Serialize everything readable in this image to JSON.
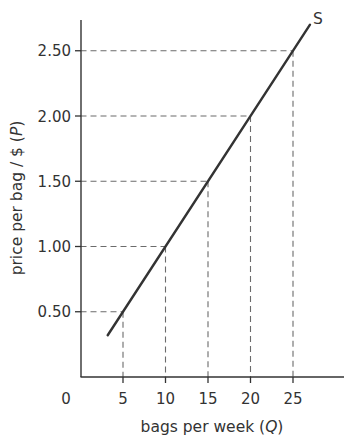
{
  "chart_data": {
    "type": "line",
    "title": "",
    "xlabel": "bags per week (Q)",
    "xlabel_parts": {
      "text": "bags per week (",
      "var": "Q",
      "close": ")"
    },
    "ylabel": "price per bag / $ (P)",
    "ylabel_parts": {
      "text": "price per bag / $ (",
      "var": "P",
      "close": ")"
    },
    "origin_label": "0",
    "x_ticks": [
      5,
      10,
      15,
      20,
      25
    ],
    "x_tick_labels": [
      "5",
      "10",
      "15",
      "20",
      "25"
    ],
    "y_ticks": [
      0.5,
      1.0,
      1.5,
      2.0,
      2.5
    ],
    "y_tick_labels": [
      "0.50",
      "1.00",
      "1.50",
      "2.00",
      "2.50"
    ],
    "xlim": [
      0,
      30
    ],
    "ylim": [
      0,
      2.75
    ],
    "grid": false,
    "legend": "none",
    "series": [
      {
        "name": "S",
        "label": "S",
        "x": [
          3.2,
          27
        ],
        "y": [
          0.32,
          2.7
        ],
        "points": [
          {
            "Q": 5,
            "P": 0.5
          },
          {
            "Q": 10,
            "P": 1.0
          },
          {
            "Q": 15,
            "P": 1.5
          },
          {
            "Q": 20,
            "P": 2.0
          },
          {
            "Q": 25,
            "P": 2.5
          }
        ]
      }
    ],
    "annotations": [
      "dashed reference lines from each (Q, P) point to both axes"
    ],
    "colors": {
      "line": "#333333",
      "axis": "#333333",
      "dashed": "#6b6b6b",
      "text": "#333333"
    }
  }
}
